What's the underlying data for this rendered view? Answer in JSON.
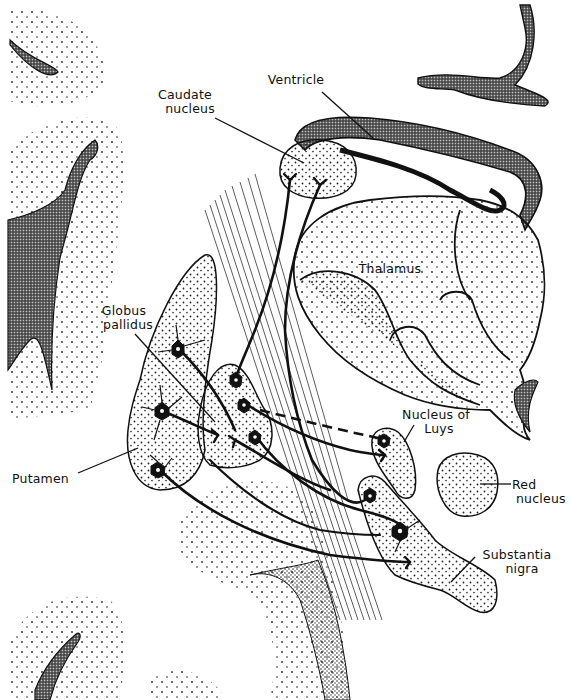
{
  "figure": {
    "style": "black-and-white stippled anatomical drawing",
    "colors": {
      "ink": "#111111",
      "background": "#ffffff",
      "stipple": "#222222",
      "dark_fill": "#555555"
    }
  },
  "labels": {
    "ventricle": "Ventricle",
    "caudate_line1": "Caudate",
    "caudate_line2": "nucleus",
    "thalamus": "Thalamus",
    "globus_line1": "Globus",
    "globus_line2": "pallidus",
    "putamen": "Putamen",
    "luys_line1": "Nucleus of",
    "luys_line2": "Luys",
    "red_line1": "Red",
    "red_line2": "nucleus",
    "sn_line1": "Substantia",
    "sn_line2": "nigra"
  },
  "structures": [
    {
      "name": "Ventricle",
      "position": [
        440,
        160
      ]
    },
    {
      "name": "Caudate nucleus",
      "position": [
        318,
        168
      ]
    },
    {
      "name": "Thalamus",
      "position": [
        415,
        270
      ]
    },
    {
      "name": "Globus pallidus",
      "position": [
        240,
        420
      ]
    },
    {
      "name": "Putamen",
      "position": [
        170,
        420
      ]
    },
    {
      "name": "Nucleus of Luys",
      "position": [
        398,
        460
      ]
    },
    {
      "name": "Red nucleus",
      "position": [
        468,
        483
      ]
    },
    {
      "name": "Substantia nigra",
      "position": [
        440,
        560
      ]
    },
    {
      "name": "Internal capsule fibers",
      "position": [
        300,
        400
      ]
    }
  ],
  "neurons": [
    {
      "region": "Putamen",
      "count": 3
    },
    {
      "region": "Globus pallidus",
      "count": 3
    },
    {
      "region": "Nucleus of Luys",
      "count": 1
    },
    {
      "region": "Substantia nigra",
      "count": 2
    }
  ]
}
